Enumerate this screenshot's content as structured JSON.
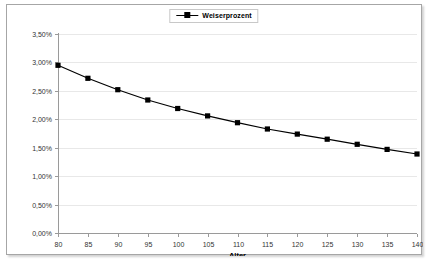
{
  "chart_data": {
    "type": "line",
    "title": "",
    "xlabel": "Alter",
    "ylabel": "",
    "legend_position": "top-center",
    "grid": "horizontal",
    "categories": [
      80,
      85,
      90,
      95,
      100,
      105,
      110,
      115,
      120,
      125,
      130,
      135,
      140
    ],
    "x_tick_labels": [
      "80",
      "85",
      "90",
      "95",
      "100",
      "105",
      "110",
      "115",
      "120",
      "125",
      "130",
      "135",
      "140"
    ],
    "y_tick_labels": [
      "0,00%",
      "0,50%",
      "1,00%",
      "1,50%",
      "2,00%",
      "2,50%",
      "3,00%",
      "3,50%"
    ],
    "y_tick_values": [
      0.0,
      0.5,
      1.0,
      1.5,
      2.0,
      2.5,
      3.0,
      3.5
    ],
    "ylim": [
      0.0,
      3.5
    ],
    "xlim": [
      80,
      140
    ],
    "series": [
      {
        "name": "Weiserprozent",
        "marker": "square",
        "color": "#000000",
        "values": [
          2.95,
          2.72,
          2.52,
          2.34,
          2.19,
          2.06,
          1.94,
          1.83,
          1.74,
          1.65,
          1.56,
          1.47,
          1.39
        ]
      }
    ]
  },
  "legend": {
    "entries": [
      {
        "label": "Weiserprozent"
      }
    ]
  },
  "axes": {
    "x_title": "Alter"
  },
  "colors": {
    "series": "#000000",
    "gridline": "#e8e8e8",
    "axis": "#9a9a9a",
    "plot_background": "#ffffff",
    "frame_border": "#a6a6a6"
  }
}
